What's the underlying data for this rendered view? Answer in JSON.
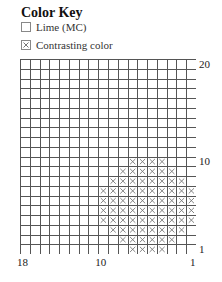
{
  "key": {
    "title": "Color Key",
    "items": [
      {
        "label": "Lime (MC)",
        "symbol": "blank"
      },
      {
        "label": "Contrasting color",
        "symbol": "x"
      }
    ]
  },
  "chart": {
    "columns": 18,
    "rows": 20,
    "row_labels": [
      {
        "row": 20,
        "text": "20"
      },
      {
        "row": 10,
        "text": "10"
      },
      {
        "row": 1,
        "text": "1"
      }
    ],
    "col_labels": [
      {
        "col": 18,
        "text": "18"
      },
      {
        "col": 10,
        "text": "10"
      },
      {
        "col": 1,
        "text": "1"
      }
    ],
    "contrast_cells": {
      "10": [
        7,
        6,
        5,
        4
      ],
      "9": [
        8,
        7,
        6,
        5,
        4,
        3
      ],
      "8": [
        9,
        8,
        7,
        6,
        5,
        4,
        3,
        2
      ],
      "7": [
        10,
        9,
        8,
        7,
        6,
        5,
        4,
        3,
        2,
        1
      ],
      "6": [
        10,
        9,
        8,
        7,
        6,
        5,
        4,
        3,
        2,
        1
      ],
      "5": [
        10,
        9,
        8,
        7,
        6,
        5,
        4,
        3,
        2,
        1
      ],
      "4": [
        10,
        9,
        8,
        7,
        6,
        5,
        4,
        3,
        2,
        1
      ],
      "3": [
        9,
        8,
        7,
        6,
        5,
        4,
        3,
        2
      ],
      "2": [
        8,
        7,
        6,
        5,
        4,
        3
      ],
      "1": [
        7,
        6,
        5,
        4
      ]
    }
  }
}
